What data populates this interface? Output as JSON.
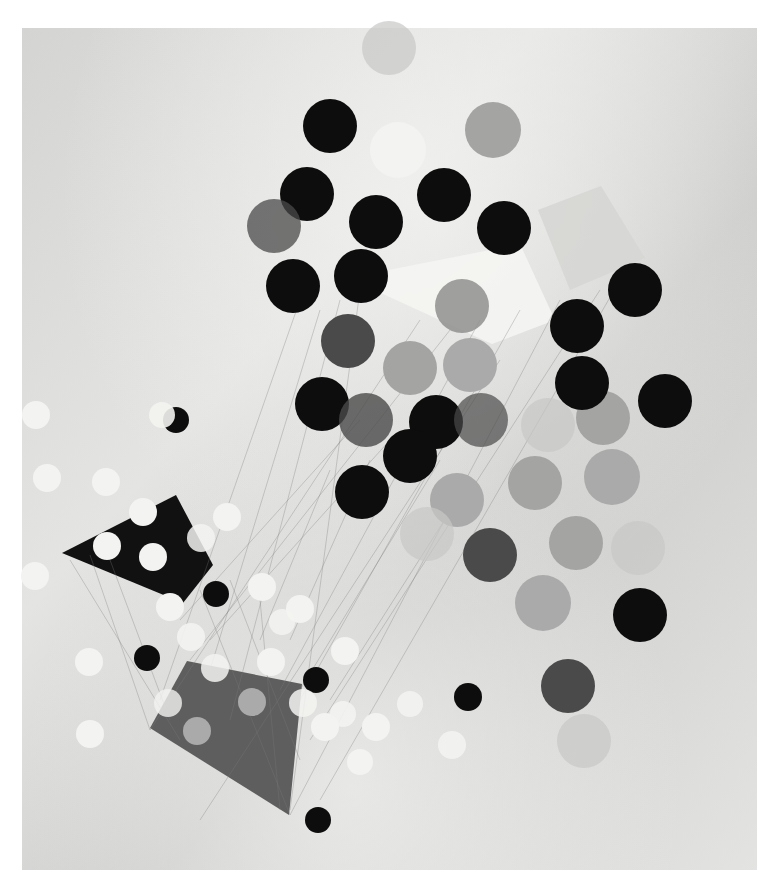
{
  "artwork": {
    "title": "Abstract constructivist composition with circles and quadrilaterals",
    "canvas": {
      "x": 22,
      "y": 28,
      "w": 735,
      "h": 842,
      "color_light": "#e6e6e4",
      "color_mid": "#cfcfcd",
      "color_dark": "#bdbdbb"
    },
    "colors": {
      "black": "#0d0d0d",
      "dark": "#4a4a4a",
      "mid": "#8f8f8f",
      "light_gray": "#aaaaaa",
      "white": "#f3f3f1",
      "textured": "#a4a4a2",
      "faint": "#c8c8c6",
      "line": "#7a7a7a"
    },
    "quads": [
      {
        "name": "white-trapezoid",
        "points": "348,278 520,244 555,320 492,344",
        "fill": "#f4f4f2",
        "opacity": 0.92
      },
      {
        "name": "pale-square",
        "points": "538,210 601,186 645,258 570,290",
        "fill": "#d6d6d4",
        "opacity": 0.9
      },
      {
        "name": "black-kite",
        "points": "62,553 176,495 213,565 183,603",
        "fill": "#111111",
        "opacity": 1
      },
      {
        "name": "gray-trapezoid",
        "points": "150,728 187,661 302,684 289,815",
        "fill": "#5e5e5e",
        "opacity": 1
      }
    ],
    "lines": [
      [
        300,
        300,
        160,
        700
      ],
      [
        320,
        310,
        210,
        670
      ],
      [
        340,
        300,
        230,
        720
      ],
      [
        360,
        290,
        290,
        810
      ],
      [
        420,
        320,
        150,
        730
      ],
      [
        450,
        330,
        190,
        660
      ],
      [
        480,
        320,
        280,
        690
      ],
      [
        520,
        310,
        300,
        700
      ],
      [
        560,
        300,
        290,
        815
      ],
      [
        600,
        290,
        310,
        740
      ],
      [
        620,
        280,
        320,
        800
      ],
      [
        500,
        360,
        200,
        820
      ],
      [
        90,
        555,
        150,
        730
      ],
      [
        110,
        560,
        170,
        720
      ],
      [
        70,
        560,
        180,
        740
      ],
      [
        200,
        590,
        290,
        815
      ],
      [
        230,
        580,
        300,
        760
      ],
      [
        260,
        600,
        280,
        810
      ],
      [
        330,
        470,
        260,
        640
      ],
      [
        370,
        460,
        290,
        640
      ],
      [
        440,
        460,
        300,
        690
      ],
      [
        470,
        480,
        330,
        700
      ],
      [
        360,
        420,
        180,
        620
      ],
      [
        390,
        440,
        210,
        640
      ]
    ],
    "circles": [
      {
        "cx": 389,
        "cy": 48,
        "r": 27,
        "tone": "faint"
      },
      {
        "cx": 330,
        "cy": 126,
        "r": 27,
        "tone": "black"
      },
      {
        "cx": 398,
        "cy": 150,
        "r": 28,
        "tone": "white"
      },
      {
        "cx": 493,
        "cy": 130,
        "r": 28,
        "tone": "textured"
      },
      {
        "cx": 307,
        "cy": 194,
        "r": 27,
        "tone": "black"
      },
      {
        "cx": 274,
        "cy": 226,
        "r": 27,
        "tone": "dark",
        "opacity": 0.75
      },
      {
        "cx": 376,
        "cy": 222,
        "r": 27,
        "tone": "black"
      },
      {
        "cx": 444,
        "cy": 195,
        "r": 27,
        "tone": "black"
      },
      {
        "cx": 504,
        "cy": 228,
        "r": 27,
        "tone": "black"
      },
      {
        "cx": 293,
        "cy": 286,
        "r": 27,
        "tone": "black"
      },
      {
        "cx": 361,
        "cy": 276,
        "r": 27,
        "tone": "black"
      },
      {
        "cx": 462,
        "cy": 306,
        "r": 27,
        "tone": "mid",
        "opacity": 0.85
      },
      {
        "cx": 348,
        "cy": 341,
        "r": 27,
        "tone": "dark"
      },
      {
        "cx": 410,
        "cy": 368,
        "r": 27,
        "tone": "textured"
      },
      {
        "cx": 470,
        "cy": 365,
        "r": 27,
        "tone": "light_gray"
      },
      {
        "cx": 322,
        "cy": 404,
        "r": 27,
        "tone": "black"
      },
      {
        "cx": 366,
        "cy": 420,
        "r": 27,
        "tone": "dark",
        "opacity": 0.8
      },
      {
        "cx": 436,
        "cy": 422,
        "r": 27,
        "tone": "black"
      },
      {
        "cx": 481,
        "cy": 420,
        "r": 27,
        "tone": "dark",
        "opacity": 0.7
      },
      {
        "cx": 410,
        "cy": 456,
        "r": 27,
        "tone": "black"
      },
      {
        "cx": 362,
        "cy": 492,
        "r": 27,
        "tone": "black"
      },
      {
        "cx": 457,
        "cy": 500,
        "r": 27,
        "tone": "light_gray"
      },
      {
        "cx": 427,
        "cy": 534,
        "r": 27,
        "tone": "faint"
      },
      {
        "cx": 490,
        "cy": 555,
        "r": 27,
        "tone": "dark"
      },
      {
        "cx": 548,
        "cy": 425,
        "r": 27,
        "tone": "faint"
      },
      {
        "cx": 603,
        "cy": 418,
        "r": 27,
        "tone": "textured"
      },
      {
        "cx": 535,
        "cy": 483,
        "r": 27,
        "tone": "textured"
      },
      {
        "cx": 612,
        "cy": 477,
        "r": 28,
        "tone": "light_gray"
      },
      {
        "cx": 576,
        "cy": 543,
        "r": 27,
        "tone": "textured"
      },
      {
        "cx": 638,
        "cy": 548,
        "r": 27,
        "tone": "faint"
      },
      {
        "cx": 635,
        "cy": 290,
        "r": 27,
        "tone": "black"
      },
      {
        "cx": 577,
        "cy": 326,
        "r": 27,
        "tone": "black"
      },
      {
        "cx": 582,
        "cy": 383,
        "r": 27,
        "tone": "black"
      },
      {
        "cx": 665,
        "cy": 401,
        "r": 27,
        "tone": "black"
      },
      {
        "cx": 584,
        "cy": 741,
        "r": 27,
        "tone": "faint"
      },
      {
        "cx": 543,
        "cy": 603,
        "r": 28,
        "tone": "light_gray"
      },
      {
        "cx": 640,
        "cy": 615,
        "r": 27,
        "tone": "black"
      },
      {
        "cx": 568,
        "cy": 686,
        "r": 27,
        "tone": "dark"
      },
      {
        "cx": 36,
        "cy": 415,
        "r": 14,
        "tone": "white"
      },
      {
        "cx": 176,
        "cy": 420,
        "r": 13,
        "tone": "black"
      },
      {
        "cx": 162,
        "cy": 415,
        "r": 13,
        "tone": "white",
        "opacity": 0.9
      },
      {
        "cx": 47,
        "cy": 478,
        "r": 14,
        "tone": "white"
      },
      {
        "cx": 106,
        "cy": 482,
        "r": 14,
        "tone": "white"
      },
      {
        "cx": 143,
        "cy": 512,
        "r": 14,
        "tone": "white"
      },
      {
        "cx": 227,
        "cy": 517,
        "r": 14,
        "tone": "white"
      },
      {
        "cx": 107,
        "cy": 546,
        "r": 14,
        "tone": "white"
      },
      {
        "cx": 153,
        "cy": 557,
        "r": 14,
        "tone": "white"
      },
      {
        "cx": 201,
        "cy": 538,
        "r": 14,
        "tone": "white",
        "opacity": 0.85
      },
      {
        "cx": 35,
        "cy": 576,
        "r": 14,
        "tone": "white"
      },
      {
        "cx": 216,
        "cy": 594,
        "r": 13,
        "tone": "black"
      },
      {
        "cx": 262,
        "cy": 587,
        "r": 14,
        "tone": "white"
      },
      {
        "cx": 170,
        "cy": 607,
        "r": 14,
        "tone": "white"
      },
      {
        "cx": 300,
        "cy": 609,
        "r": 14,
        "tone": "white"
      },
      {
        "cx": 282,
        "cy": 622,
        "r": 13,
        "tone": "white",
        "opacity": 0.85
      },
      {
        "cx": 191,
        "cy": 637,
        "r": 14,
        "tone": "white",
        "opacity": 0.9
      },
      {
        "cx": 89,
        "cy": 662,
        "r": 14,
        "tone": "white"
      },
      {
        "cx": 147,
        "cy": 658,
        "r": 13,
        "tone": "black"
      },
      {
        "cx": 215,
        "cy": 668,
        "r": 14,
        "tone": "white",
        "opacity": 0.85
      },
      {
        "cx": 271,
        "cy": 662,
        "r": 14,
        "tone": "white"
      },
      {
        "cx": 345,
        "cy": 651,
        "r": 14,
        "tone": "white"
      },
      {
        "cx": 316,
        "cy": 680,
        "r": 13,
        "tone": "black"
      },
      {
        "cx": 168,
        "cy": 703,
        "r": 14,
        "tone": "white",
        "opacity": 0.8
      },
      {
        "cx": 252,
        "cy": 702,
        "r": 14,
        "tone": "light_gray"
      },
      {
        "cx": 303,
        "cy": 703,
        "r": 14,
        "tone": "white",
        "opacity": 0.85
      },
      {
        "cx": 343,
        "cy": 714,
        "r": 13,
        "tone": "white",
        "opacity": 0.9
      },
      {
        "cx": 325,
        "cy": 727,
        "r": 14,
        "tone": "white"
      },
      {
        "cx": 376,
        "cy": 727,
        "r": 14,
        "tone": "white"
      },
      {
        "cx": 410,
        "cy": 704,
        "r": 13,
        "tone": "white",
        "opacity": 0.9
      },
      {
        "cx": 197,
        "cy": 731,
        "r": 14,
        "tone": "light_gray"
      },
      {
        "cx": 90,
        "cy": 734,
        "r": 14,
        "tone": "white"
      },
      {
        "cx": 360,
        "cy": 762,
        "r": 13,
        "tone": "white"
      },
      {
        "cx": 452,
        "cy": 745,
        "r": 14,
        "tone": "white",
        "opacity": 0.9
      },
      {
        "cx": 468,
        "cy": 697,
        "r": 14,
        "tone": "black"
      },
      {
        "cx": 318,
        "cy": 820,
        "r": 13,
        "tone": "black"
      }
    ]
  }
}
